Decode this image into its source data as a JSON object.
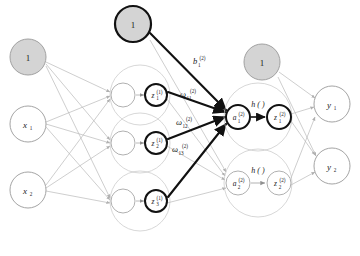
{
  "figure": {
    "kind": "neural-network-diagram",
    "title": "",
    "background": "#ffffff",
    "width": 360,
    "height": 256
  },
  "palette": {
    "bias_fill": "#d4d4d4",
    "bias_stroke": "#9a9a9a",
    "node_fill": "#ffffff",
    "node_stroke": "#8c8c8c",
    "faint_stroke": "#b9b9b9",
    "highlight_stroke": "#111111",
    "text": "#1a1a1a",
    "group_stroke": "#c2c2c2"
  },
  "nodes": {
    "input_layer": [
      {
        "id": "bias-input",
        "label": "1",
        "type": "bias",
        "cx": 28,
        "cy": 57,
        "r": 18,
        "highlighted": false
      },
      {
        "id": "input-x1",
        "label": "x",
        "sub": "1",
        "type": "input",
        "cx": 28,
        "cy": 124,
        "r": 18,
        "highlighted": false
      },
      {
        "id": "input-x2",
        "label": "x",
        "sub": "2",
        "type": "input",
        "cx": 28,
        "cy": 190,
        "r": 18,
        "highlighted": false
      }
    ],
    "hidden_bias": {
      "id": "bias-hidden",
      "label": "1",
      "type": "bias",
      "cx": 133,
      "cy": 24,
      "r": 18,
      "highlighted": true
    },
    "hidden_layer": [
      {
        "id": "hidden-a1",
        "a_label": "",
        "z_label": "z",
        "z_sub": "1",
        "z_sup": "(1)",
        "ax": 123,
        "ay": 95,
        "zx": 156,
        "zy": 95,
        "r": 13,
        "zr": 11,
        "group_cx": 140,
        "group_cy": 95,
        "group_r": 30,
        "highlighted": true
      },
      {
        "id": "hidden-a2",
        "a_label": "",
        "z_label": "z",
        "z_sub": "2",
        "z_sup": "(1)",
        "ax": 123,
        "ay": 143,
        "zx": 156,
        "zy": 143,
        "r": 13,
        "zr": 11,
        "group_cx": 140,
        "group_cy": 143,
        "group_r": 30,
        "highlighted": true
      },
      {
        "id": "hidden-a3",
        "a_label": "",
        "z_label": "z",
        "z_sub": "3",
        "z_sup": "(1)",
        "ax": 123,
        "ay": 201,
        "zx": 156,
        "zy": 201,
        "r": 13,
        "zr": 11,
        "group_cx": 140,
        "group_cy": 201,
        "group_r": 30,
        "highlighted": true
      }
    ],
    "output_bias": {
      "id": "bias-output",
      "label": "1",
      "type": "bias",
      "cx": 262,
      "cy": 62,
      "r": 18,
      "highlighted": false
    },
    "output_units": [
      {
        "id": "unit-1",
        "a_label": "a",
        "a_sub": "1",
        "a_sup": "(2)",
        "h_label": "h ( )",
        "z_label": "z",
        "z_sub": "1",
        "z_sup": "(2)",
        "ax": 238,
        "ay": 117,
        "zx": 279,
        "zy": 117,
        "r": 12,
        "group_cx": 258,
        "group_cy": 117,
        "group_r": 34,
        "highlighted": true
      },
      {
        "id": "unit-2",
        "a_label": "a",
        "a_sub": "2",
        "a_sup": "(2)",
        "h_label": "h ( )",
        "z_label": "z",
        "z_sub": "2",
        "z_sup": "(2)",
        "ax": 238,
        "ay": 183,
        "zx": 279,
        "zy": 183,
        "r": 12,
        "group_cx": 258,
        "group_cy": 183,
        "group_r": 34,
        "highlighted": false
      }
    ],
    "output_layer": [
      {
        "id": "output-y1",
        "label": "y",
        "sub": "1",
        "cx": 332,
        "cy": 104,
        "r": 18,
        "highlighted": false
      },
      {
        "id": "output-y2",
        "label": "y",
        "sub": "2",
        "cx": 332,
        "cy": 166,
        "r": 18,
        "highlighted": false
      }
    ]
  },
  "edge_labels": [
    {
      "id": "bias-weight",
      "base": "b",
      "sub": "1",
      "sup": "(2)",
      "x": 196,
      "y": 64
    },
    {
      "id": "weight-11",
      "base": "ω",
      "sub": "11",
      "sup": "(2)",
      "x": 184,
      "y": 97
    },
    {
      "id": "weight-12",
      "base": "ω",
      "sub": "12",
      "sup": "(2)",
      "x": 180,
      "y": 125
    },
    {
      "id": "weight-13",
      "base": "ω",
      "sub": "13",
      "sup": "(2)",
      "x": 176,
      "y": 152
    }
  ],
  "annotations": {
    "activation_text": "h ( )",
    "bias_value": "1"
  }
}
